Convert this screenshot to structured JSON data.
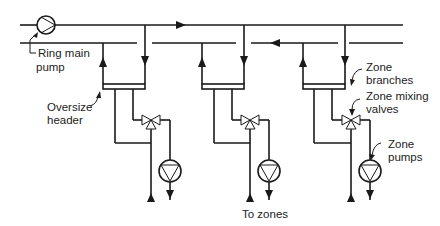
{
  "diagram": {
    "labels": {
      "ring_main_pump_line1": "Ring main",
      "ring_main_pump_line2": "pump",
      "oversize_header_line1": "Oversize",
      "oversize_header_line2": "header",
      "zone_branches_line1": "Zone",
      "zone_branches_line2": "branches",
      "zone_mixing_valves_line1": "Zone mixing",
      "zone_mixing_valves_line2": "valves",
      "zone_pumps_line1": "Zone",
      "zone_pumps_line2": "pumps",
      "to_zones": "To zones"
    },
    "zones": [
      {
        "id": 1,
        "x_return": 103,
        "x_supply": 145
      },
      {
        "id": 2,
        "x_return": 202,
        "x_supply": 244
      },
      {
        "id": 3,
        "x_return": 345,
        "x_supply": 387
      }
    ],
    "colors": {
      "line": "#1a1a1a",
      "background": "#ffffff"
    }
  }
}
